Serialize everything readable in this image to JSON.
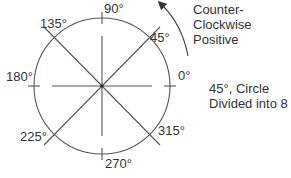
{
  "diagram": {
    "angle_labels": [
      {
        "angle": 0,
        "text": "0°"
      },
      {
        "angle": 45,
        "text": "45°"
      },
      {
        "angle": 90,
        "text": "90°"
      },
      {
        "angle": 135,
        "text": "135°"
      },
      {
        "angle": 180,
        "text": "180°"
      },
      {
        "angle": 225,
        "text": "225°"
      },
      {
        "angle": 270,
        "text": "270°"
      },
      {
        "angle": 315,
        "text": "315°"
      }
    ],
    "direction_note": {
      "line1": "Counter-",
      "line2": "Clockwise",
      "line3": "Positive"
    },
    "division_note": {
      "line1": "45°, Circle",
      "line2": "Divided into 8"
    },
    "colors": {
      "line": "#555555",
      "text": "#333333",
      "background": "#ffffff"
    }
  }
}
